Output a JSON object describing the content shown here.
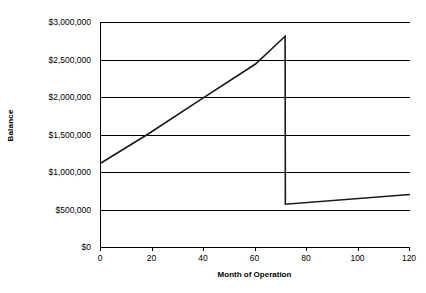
{
  "chart_data": {
    "type": "line",
    "title": "",
    "xlabel": "Month of Operation",
    "ylabel": "Balance",
    "xlim": [
      0,
      120
    ],
    "ylim": [
      0,
      3000000
    ],
    "grid": true,
    "legend": "none",
    "x_ticks": [
      0,
      20,
      40,
      60,
      80,
      100,
      120
    ],
    "x_tick_labels": [
      "0",
      "20",
      "40",
      "60",
      "80",
      "100",
      "120"
    ],
    "y_ticks": [
      0,
      500000,
      1000000,
      1500000,
      2000000,
      2500000,
      3000000
    ],
    "y_tick_labels": [
      "$0",
      "$500,000",
      "$1,000,000",
      "$1,500,000",
      "$2,000,000",
      "$2,500,000",
      "$3,000,000"
    ],
    "series": [
      {
        "name": "Balance",
        "color": "#1a1a1a",
        "x": [
          0,
          18,
          40,
          60,
          71.5,
          71.6,
          120
        ],
        "y": [
          1120000,
          1500000,
          1995000,
          2440000,
          2810000,
          570000,
          700000
        ],
        "points": [
          {
            "x": 0,
            "y": 1120000
          },
          {
            "x": 18,
            "y": 1500000
          },
          {
            "x": 40,
            "y": 1995000
          },
          {
            "x": 60,
            "y": 2440000
          },
          {
            "x": 71.5,
            "y": 2810000
          },
          {
            "x": 71.6,
            "y": 570000
          },
          {
            "x": 120,
            "y": 700000
          }
        ]
      }
    ],
    "annotations": [
      "Linear accumulation from $1,120,000 at month 0 to a peak of about $2,810,000 near month 72",
      "Sharp vertical drop at about month 72 down to roughly $570,000",
      "Slow linear growth afterwards reaching about $700,000 at month 120"
    ]
  }
}
